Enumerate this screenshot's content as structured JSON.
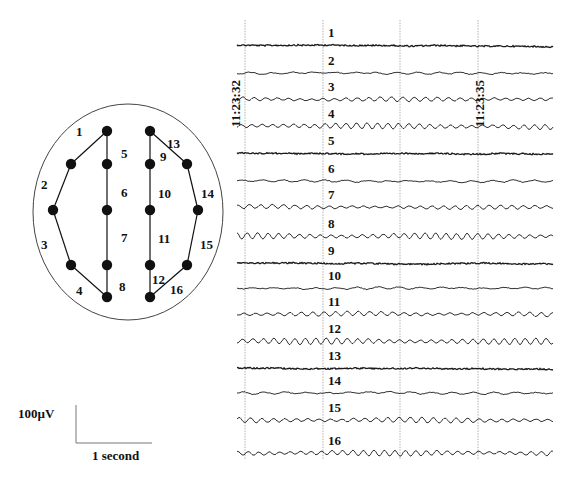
{
  "figure": {
    "type": "EEG recording with electrode montage",
    "colors": {
      "ink": "#111111",
      "grid": "#9a9a9a",
      "outline": "#444444",
      "trace": "#1a1a1a"
    }
  },
  "montage": {
    "head": {
      "cx": 128,
      "cy": 212,
      "rx": 95,
      "ry": 108
    },
    "electrodes": [
      {
        "id": "L-top",
        "x": 107,
        "y": 131
      },
      {
        "id": "L-f",
        "x": 71,
        "y": 164
      },
      {
        "id": "L-mid",
        "x": 53,
        "y": 210
      },
      {
        "id": "L-p",
        "x": 71,
        "y": 265
      },
      {
        "id": "L-bot",
        "x": 107,
        "y": 297
      },
      {
        "id": "LC-f",
        "x": 107,
        "y": 164
      },
      {
        "id": "LC-mid",
        "x": 107,
        "y": 210
      },
      {
        "id": "LC-p",
        "x": 107,
        "y": 265
      },
      {
        "id": "R-top",
        "x": 150,
        "y": 131
      },
      {
        "id": "RC-f",
        "x": 150,
        "y": 164
      },
      {
        "id": "RC-mid",
        "x": 150,
        "y": 210
      },
      {
        "id": "RC-p",
        "x": 150,
        "y": 265
      },
      {
        "id": "R-bot",
        "x": 150,
        "y": 297
      },
      {
        "id": "R-f",
        "x": 187,
        "y": 164
      },
      {
        "id": "R-mid",
        "x": 198,
        "y": 210
      },
      {
        "id": "R-p",
        "x": 187,
        "y": 265
      }
    ],
    "channels": [
      {
        "label": "1",
        "from": "L-top",
        "to": "L-f",
        "lx": 76,
        "ly": 136
      },
      {
        "label": "2",
        "from": "L-f",
        "to": "L-mid",
        "lx": 41,
        "ly": 189
      },
      {
        "label": "3",
        "from": "L-mid",
        "to": "L-p",
        "lx": 41,
        "ly": 249
      },
      {
        "label": "4",
        "from": "L-p",
        "to": "L-bot",
        "lx": 76,
        "ly": 295
      },
      {
        "label": "5",
        "from": "L-top",
        "to": "LC-f",
        "lx": 121,
        "ly": 158
      },
      {
        "label": "6",
        "from": "LC-f",
        "to": "LC-mid",
        "lx": 121,
        "ly": 197
      },
      {
        "label": "7",
        "from": "LC-mid",
        "to": "LC-p",
        "lx": 121,
        "ly": 242
      },
      {
        "label": "8",
        "from": "LC-p",
        "to": "L-bot",
        "lx": 119,
        "ly": 291
      },
      {
        "label": "9",
        "from": "R-top",
        "to": "RC-f",
        "lx": 160,
        "ly": 161
      },
      {
        "label": "10",
        "from": "RC-f",
        "to": "RC-mid",
        "lx": 158,
        "ly": 198
      },
      {
        "label": "11",
        "from": "RC-mid",
        "to": "RC-p",
        "lx": 158,
        "ly": 243
      },
      {
        "label": "12",
        "from": "RC-p",
        "to": "R-bot",
        "lx": 152,
        "ly": 284
      },
      {
        "label": "13",
        "from": "R-top",
        "to": "R-f",
        "lx": 167,
        "ly": 148
      },
      {
        "label": "14",
        "from": "R-f",
        "to": "R-mid",
        "lx": 201,
        "ly": 198
      },
      {
        "label": "15",
        "from": "R-mid",
        "to": "R-p",
        "lx": 200,
        "ly": 249
      },
      {
        "label": "16",
        "from": "R-p",
        "to": "R-bot",
        "lx": 170,
        "ly": 294
      }
    ]
  },
  "scale_bar": {
    "voltage_label": "100µV",
    "time_label": "1 second",
    "x": 76,
    "y_top": 405,
    "y_bottom": 443,
    "x_end": 152
  },
  "recording": {
    "x_start": 237,
    "x_end": 553,
    "gridlines": [
      245,
      323,
      400,
      478
    ],
    "grid_top": 20,
    "grid_bottom": 460,
    "timestamps": [
      {
        "text": "11:23:32",
        "x": 240,
        "y": 87
      },
      {
        "text": "11:23:35",
        "x": 484,
        "y": 87
      }
    ],
    "label_x": 328,
    "traces": [
      {
        "label": "1",
        "y": 45,
        "amp": 1.2,
        "freq": 0.0,
        "noise": 1.4
      },
      {
        "label": "2",
        "y": 73,
        "amp": 1.0,
        "freq": 0.3,
        "noise": 0.8
      },
      {
        "label": "3",
        "y": 99,
        "amp": 2.0,
        "freq": 0.55,
        "noise": 0.6
      },
      {
        "label": "4",
        "y": 126,
        "amp": 2.6,
        "freq": 0.6,
        "noise": 0.5
      },
      {
        "label": "5",
        "y": 153,
        "amp": 1.2,
        "freq": 0.0,
        "noise": 1.4
      },
      {
        "label": "6",
        "y": 181,
        "amp": 1.0,
        "freq": 0.3,
        "noise": 0.8
      },
      {
        "label": "7",
        "y": 207,
        "amp": 1.8,
        "freq": 0.55,
        "noise": 0.6
      },
      {
        "label": "8",
        "y": 236,
        "amp": 2.8,
        "freq": 0.6,
        "noise": 0.5
      },
      {
        "label": "9",
        "y": 263,
        "amp": 1.2,
        "freq": 0.0,
        "noise": 1.4
      },
      {
        "label": "10",
        "y": 288,
        "amp": 1.0,
        "freq": 0.3,
        "noise": 0.8
      },
      {
        "label": "11",
        "y": 314,
        "amp": 2.0,
        "freq": 0.55,
        "noise": 0.6
      },
      {
        "label": "12",
        "y": 341,
        "amp": 2.8,
        "freq": 0.6,
        "noise": 0.5
      },
      {
        "label": "13",
        "y": 368,
        "amp": 1.2,
        "freq": 0.0,
        "noise": 1.4
      },
      {
        "label": "14",
        "y": 393,
        "amp": 1.0,
        "freq": 0.3,
        "noise": 0.8
      },
      {
        "label": "15",
        "y": 420,
        "amp": 2.4,
        "freq": 0.55,
        "noise": 0.6
      },
      {
        "label": "16",
        "y": 453,
        "amp": 2.6,
        "freq": 0.6,
        "noise": 0.5
      }
    ]
  }
}
